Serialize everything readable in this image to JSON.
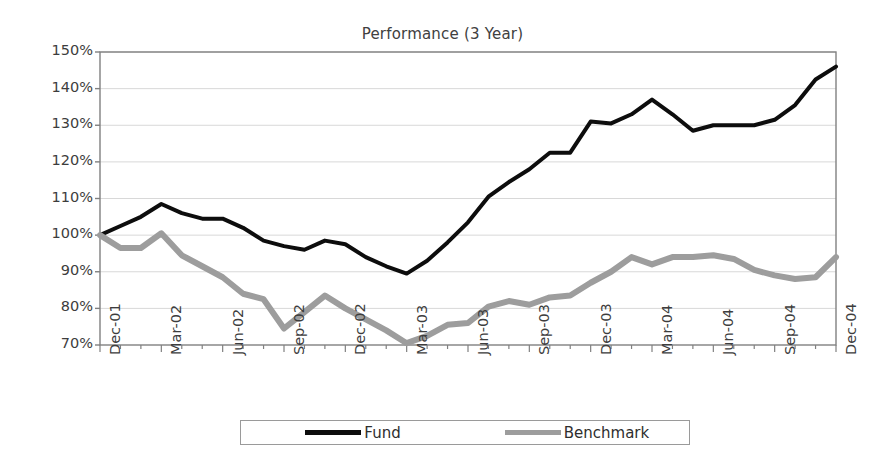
{
  "chart_data": {
    "type": "line",
    "title": "Performance (3 Year)",
    "xlabel": "",
    "ylabel": "",
    "ylim": [
      70,
      150
    ],
    "ytick_values": [
      70,
      80,
      90,
      100,
      110,
      120,
      130,
      140,
      150
    ],
    "ytick_labels": [
      "70%",
      "80%",
      "90%",
      "100%",
      "110%",
      "120%",
      "130%",
      "140%",
      "150%"
    ],
    "grid": true,
    "grid_axis": "y",
    "legend_position": "bottom",
    "x": [
      "Dec-01",
      "Jan-02",
      "Feb-02",
      "Mar-02",
      "Apr-02",
      "May-02",
      "Jun-02",
      "Jul-02",
      "Aug-02",
      "Sep-02",
      "Oct-02",
      "Nov-02",
      "Dec-02",
      "Jan-03",
      "Feb-03",
      "Mar-03",
      "Apr-03",
      "May-03",
      "Jun-03",
      "Jul-03",
      "Aug-03",
      "Sep-03",
      "Oct-03",
      "Nov-03",
      "Dec-03",
      "Jan-04",
      "Feb-04",
      "Mar-04",
      "Apr-04",
      "May-04",
      "Jun-04",
      "Jul-04",
      "Aug-04",
      "Sep-04",
      "Oct-04",
      "Nov-04",
      "Dec-04"
    ],
    "xtick_labels": [
      "Dec-01",
      "Mar-02",
      "Jun-02",
      "Sep-02",
      "Dec-02",
      "Mar-03",
      "Jun-03",
      "Sep-03",
      "Dec-03",
      "Mar-04",
      "Jun-04",
      "Sep-04",
      "Dec-04"
    ],
    "xtick_indices": [
      0,
      3,
      6,
      9,
      12,
      15,
      18,
      21,
      24,
      27,
      30,
      33,
      36
    ],
    "series": [
      {
        "name": "Fund",
        "color": "#0d0d0d",
        "line_width": 4,
        "values": [
          100.0,
          102.5,
          105.0,
          108.5,
          106.0,
          104.5,
          104.5,
          102.0,
          98.5,
          97.0,
          96.0,
          98.5,
          97.5,
          94.0,
          91.5,
          89.5,
          93.0,
          98.0,
          103.5,
          110.5,
          114.5,
          118.0,
          122.5,
          122.5,
          131.0,
          130.5,
          133.0,
          137.0,
          133.0,
          128.5,
          130.0,
          130.0,
          130.0,
          131.5,
          135.5,
          142.5,
          146.0
        ]
      },
      {
        "name": "Benchmark",
        "color": "#9d9d9d",
        "line_width": 6,
        "values": [
          100.0,
          96.5,
          96.5,
          100.5,
          94.5,
          91.5,
          88.5,
          84.0,
          82.5,
          74.5,
          79.0,
          83.5,
          80.0,
          77.0,
          74.0,
          70.5,
          72.5,
          75.5,
          76.0,
          80.5,
          82.0,
          81.0,
          83.0,
          83.5,
          87.0,
          90.0,
          94.0,
          92.0,
          94.0,
          94.0,
          94.5,
          93.5,
          90.5,
          89.0,
          88.0,
          88.5,
          94.0
        ]
      }
    ]
  },
  "legend": {
    "entries": [
      {
        "label": "Fund",
        "swatch": "fund-line-swatch"
      },
      {
        "label": "Benchmark",
        "swatch": "benchmark-line-swatch"
      }
    ]
  },
  "colors": {
    "fund": "#0d0d0d",
    "benchmark": "#9d9d9d",
    "axis": "#808080",
    "grid": "#d8d8d8",
    "text": "#3d3d3d",
    "background": "#ffffff"
  }
}
